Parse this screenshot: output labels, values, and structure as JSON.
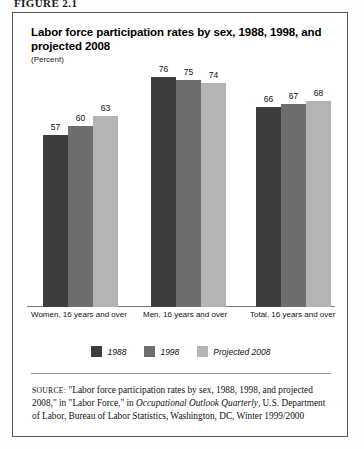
{
  "figure": {
    "label": "FIGURE 2.1"
  },
  "panel": {
    "title": "Labor force participation rates by sex, 1988, 1998, and projected 2008",
    "subtitle": "(Percent)"
  },
  "chart_data": {
    "type": "bar",
    "title": "Labor force participation rates by sex, 1988, 1998, and projected 2008",
    "subtitle": "(Percent)",
    "xlabel": "",
    "ylabel": "Percent",
    "ylim": [
      0,
      80
    ],
    "grid": false,
    "legend_position": "bottom-center",
    "categories": [
      "Women, 16 years and over",
      "Men, 16 years and over",
      "Total, 16 years and over"
    ],
    "series": [
      {
        "name": "1988",
        "color": "#3d3d3d",
        "values": [
          57,
          76,
          66
        ]
      },
      {
        "name": "1998",
        "color": "#6e6e6e",
        "values": [
          60,
          75,
          67
        ]
      },
      {
        "name": "Projected 2008",
        "color": "#b4b4b4",
        "values": [
          63,
          74,
          68
        ]
      }
    ]
  },
  "legend": {
    "items": [
      {
        "label": "1988",
        "color": "#3d3d3d"
      },
      {
        "label": "1998",
        "color": "#6e6e6e"
      },
      {
        "label": "Projected 2008",
        "color": "#b4b4b4"
      }
    ]
  },
  "source": {
    "prefix": "SOURCE:",
    "text_before_italic": " \"Labor force participation rates by sex, 1988, 1998, and projected 2008,\" in \"Labor Force,\" in ",
    "italic_title": "Occupational Outlook Quarterly",
    "text_after_italic": ", U.S. Department of Labor, Bureau of Labor Statistics, Washington, DC, Winter 1999/2000"
  }
}
